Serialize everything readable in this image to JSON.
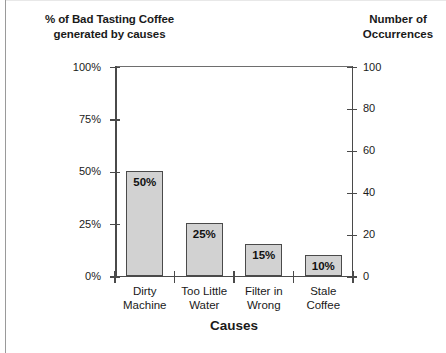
{
  "chart_data": {
    "type": "bar",
    "title": "",
    "left_axis_title": "% of Bad Tasting Coffee generated by causes",
    "left_axis_title_line1": "% of Bad Tasting Coffee",
    "left_axis_title_line2": "generated by causes",
    "right_axis_title_line1": "Number of",
    "right_axis_title_line2": "Occurrences",
    "xlabel": "Causes",
    "ylabel": "% of Bad Tasting Coffee generated by causes",
    "y2label": "Number of Occurrences",
    "categories": [
      "Dirty Machine",
      "Too Little Water",
      "Filter in Wrong",
      "Stale Coffee"
    ],
    "category_lines": [
      [
        "Dirty",
        "Machine"
      ],
      [
        "Too Little",
        "Water"
      ],
      [
        "Filter in",
        "Wrong"
      ],
      [
        "Stale",
        "Coffee"
      ]
    ],
    "values": [
      50,
      25,
      15,
      10
    ],
    "data_labels": [
      "50%",
      "25%",
      "15%",
      "10%"
    ],
    "occurrences": [
      50,
      25,
      15,
      10
    ],
    "ylim": [
      0,
      100
    ],
    "y2lim": [
      0,
      100
    ],
    "yticks": [
      0,
      25,
      50,
      75,
      100
    ],
    "ytick_labels": [
      "0%",
      "25%",
      "50%",
      "75%",
      "100%"
    ],
    "y2ticks": [
      0,
      20,
      40,
      60,
      80,
      100
    ],
    "y2tick_labels": [
      "0",
      "20",
      "40",
      "60",
      "80",
      "100"
    ],
    "grid": false,
    "legend": "none",
    "bar_fill_color": "#d2d2d2",
    "bar_edge_color": "#4a4a4a",
    "axis_color": "#4a4a4a"
  }
}
